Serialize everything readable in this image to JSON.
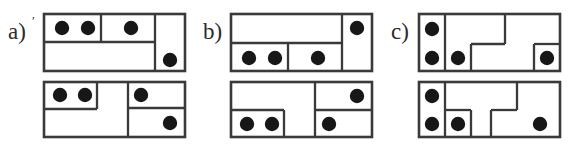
{
  "figure": {
    "background_color": "#ffffff",
    "line_color": "#3a3a3a",
    "dot_color": "#171717",
    "label_color": "#2b2b2b",
    "dot_radius": 7.2,
    "panel_count": 3,
    "diagrams_per_panel": 2
  },
  "panels": [
    {
      "id": "panel-a",
      "label": "a)",
      "label_suffix": "′",
      "label_x": 8,
      "label_y": 20,
      "origin_x": 0,
      "diagrams": [
        {
          "id": "a-top",
          "name": "upper-rectangle",
          "frame": {
            "x": 44,
            "y": 14,
            "w": 141,
            "h": 57
          },
          "dividers": [
            {
              "name": "vertical-right-column",
              "x1": 155,
              "y1": 14,
              "x2": 155,
              "y2": 71
            },
            {
              "name": "horizontal-upper-band",
              "x1": 44,
              "y1": 42,
              "x2": 155,
              "y2": 42
            },
            {
              "name": "vertical-upper-split",
              "x1": 101,
              "y1": 14,
              "x2": 101,
              "y2": 42
            }
          ],
          "dots": [
            {
              "cx": 62,
              "cy": 28
            },
            {
              "cx": 88,
              "cy": 28
            },
            {
              "cx": 131,
              "cy": 28
            },
            {
              "cx": 170,
              "cy": 60
            }
          ]
        },
        {
          "id": "a-bottom",
          "name": "lower-rectangle",
          "frame": {
            "x": 44,
            "y": 82,
            "w": 141,
            "h": 55
          },
          "dividers": [
            {
              "name": "vertical-right-column",
              "x1": 128,
              "y1": 82,
              "x2": 128,
              "y2": 137
            },
            {
              "name": "vertical-left-split",
              "x1": 97,
              "y1": 82,
              "x2": 97,
              "y2": 109
            },
            {
              "name": "horizontal-left-band",
              "x1": 44,
              "y1": 109,
              "x2": 97,
              "y2": 109
            },
            {
              "name": "horizontal-right-band",
              "x1": 128,
              "y1": 108,
              "x2": 185,
              "y2": 108
            }
          ],
          "dots": [
            {
              "cx": 60,
              "cy": 95
            },
            {
              "cx": 85,
              "cy": 95
            },
            {
              "cx": 141,
              "cy": 95
            },
            {
              "cx": 170,
              "cy": 123
            }
          ]
        }
      ]
    },
    {
      "id": "panel-b",
      "label": "b)",
      "label_suffix": "",
      "label_x": 8,
      "label_y": 20,
      "origin_x": 195,
      "diagrams": [
        {
          "id": "b-top",
          "name": "upper-rectangle",
          "frame": {
            "x": 36,
            "y": 14,
            "w": 141,
            "h": 57
          },
          "dividers": [
            {
              "name": "vertical-right-column",
              "x1": 147,
              "y1": 14,
              "x2": 147,
              "y2": 71
            },
            {
              "name": "horizontal-lower-band",
              "x1": 36,
              "y1": 43,
              "x2": 147,
              "y2": 43
            },
            {
              "name": "vertical-lower-split",
              "x1": 93,
              "y1": 43,
              "x2": 93,
              "y2": 71
            }
          ],
          "dots": [
            {
              "cx": 162,
              "cy": 28
            },
            {
              "cx": 54,
              "cy": 58
            },
            {
              "cx": 80,
              "cy": 58
            },
            {
              "cx": 123,
              "cy": 58
            }
          ]
        },
        {
          "id": "b-bottom",
          "name": "lower-rectangle",
          "frame": {
            "x": 36,
            "y": 82,
            "w": 141,
            "h": 55
          },
          "dividers": [
            {
              "name": "vertical-right-column",
              "x1": 120,
              "y1": 82,
              "x2": 120,
              "y2": 137
            },
            {
              "name": "vertical-left-split",
              "x1": 89,
              "y1": 110,
              "x2": 89,
              "y2": 137
            },
            {
              "name": "horizontal-left-band",
              "x1": 36,
              "y1": 110,
              "x2": 89,
              "y2": 110
            },
            {
              "name": "horizontal-right-band",
              "x1": 120,
              "y1": 110,
              "x2": 177,
              "y2": 110
            }
          ],
          "dots": [
            {
              "cx": 162,
              "cy": 96
            },
            {
              "cx": 52,
              "cy": 124
            },
            {
              "cx": 77,
              "cy": 124
            },
            {
              "cx": 134,
              "cy": 124
            }
          ]
        }
      ]
    },
    {
      "id": "panel-c",
      "label": "c)",
      "label_suffix": "",
      "label_x": 6,
      "label_y": 20,
      "origin_x": 385,
      "diagrams": [
        {
          "id": "c-top",
          "name": "upper-rectangle",
          "frame": {
            "x": 34,
            "y": 14,
            "w": 141,
            "h": 57
          },
          "dividers": [
            {
              "name": "vertical-left-column",
              "x1": 60,
              "y1": 14,
              "x2": 60,
              "y2": 71
            },
            {
              "name": "vertical-notch-upper",
              "x1": 120,
              "y1": 14,
              "x2": 120,
              "y2": 44
            },
            {
              "name": "horizontal-notch-step",
              "x1": 86,
              "y1": 44,
              "x2": 120,
              "y2": 44
            },
            {
              "name": "vertical-notch-lower",
              "x1": 86,
              "y1": 44,
              "x2": 86,
              "y2": 71
            },
            {
              "name": "vertical-right-cell",
              "x1": 149,
              "y1": 44,
              "x2": 149,
              "y2": 71
            },
            {
              "name": "horizontal-right-cell",
              "x1": 149,
              "y1": 44,
              "x2": 175,
              "y2": 44
            }
          ],
          "dots": [
            {
              "cx": 47,
              "cy": 29
            },
            {
              "cx": 47,
              "cy": 58
            },
            {
              "cx": 73,
              "cy": 58
            },
            {
              "cx": 162,
              "cy": 58
            }
          ]
        },
        {
          "id": "c-bottom",
          "name": "lower-rectangle",
          "frame": {
            "x": 34,
            "y": 82,
            "w": 141,
            "h": 55
          },
          "dividers": [
            {
              "name": "vertical-left-column",
              "x1": 60,
              "y1": 82,
              "x2": 60,
              "y2": 137
            },
            {
              "name": "vertical-small-cell-right",
              "x1": 86,
              "y1": 110,
              "x2": 86,
              "y2": 137
            },
            {
              "name": "horizontal-small-cell-top",
              "x1": 60,
              "y1": 110,
              "x2": 86,
              "y2": 110
            },
            {
              "name": "vertical-notch-upper",
              "x1": 132,
              "y1": 82,
              "x2": 132,
              "y2": 110
            },
            {
              "name": "horizontal-notch-step",
              "x1": 106,
              "y1": 110,
              "x2": 132,
              "y2": 110
            },
            {
              "name": "vertical-notch-lower",
              "x1": 106,
              "y1": 110,
              "x2": 106,
              "y2": 137
            }
          ],
          "dots": [
            {
              "cx": 47,
              "cy": 96
            },
            {
              "cx": 47,
              "cy": 124
            },
            {
              "cx": 73,
              "cy": 124
            },
            {
              "cx": 155,
              "cy": 124
            }
          ]
        }
      ]
    }
  ]
}
